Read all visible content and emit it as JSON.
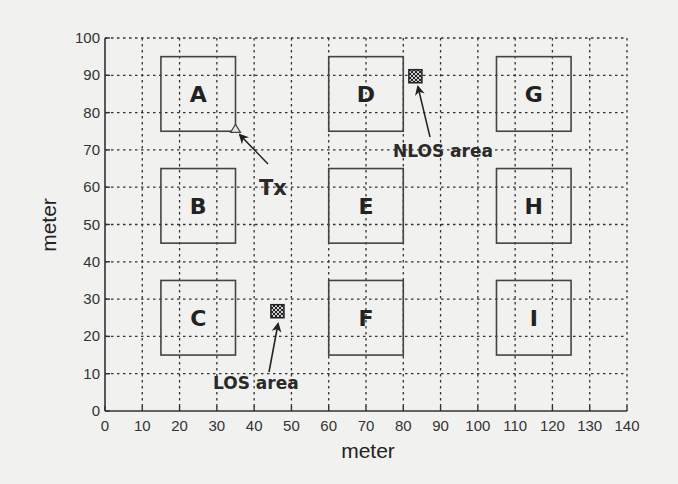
{
  "chart_data": {
    "type": "scatter",
    "title": "",
    "xlabel": "meter",
    "ylabel": "meter",
    "xlim": [
      0,
      140
    ],
    "ylim": [
      0,
      100
    ],
    "grid": true,
    "grid_style": "dotted",
    "xticks": [
      0,
      10,
      20,
      30,
      40,
      50,
      60,
      70,
      80,
      90,
      100,
      110,
      120,
      130,
      140
    ],
    "yticks": [
      0,
      10,
      20,
      30,
      40,
      50,
      60,
      70,
      80,
      90,
      100
    ],
    "buildings": [
      {
        "label": "A",
        "x0": 15,
        "x1": 35,
        "y0": 75,
        "y1": 95
      },
      {
        "label": "B",
        "x0": 15,
        "x1": 35,
        "y0": 45,
        "y1": 65
      },
      {
        "label": "C",
        "x0": 15,
        "x1": 35,
        "y0": 15,
        "y1": 35
      },
      {
        "label": "D",
        "x0": 60,
        "x1": 80,
        "y0": 75,
        "y1": 95
      },
      {
        "label": "E",
        "x0": 60,
        "x1": 80,
        "y0": 45,
        "y1": 65
      },
      {
        "label": "F",
        "x0": 60,
        "x1": 80,
        "y0": 15,
        "y1": 35
      },
      {
        "label": "G",
        "x0": 105,
        "x1": 125,
        "y0": 75,
        "y1": 95
      },
      {
        "label": "H",
        "x0": 105,
        "x1": 125,
        "y0": 45,
        "y1": 65
      },
      {
        "label": "I",
        "x0": 105,
        "x1": 125,
        "y0": 15,
        "y1": 35
      }
    ],
    "transmitter": {
      "label": "Tx",
      "x": 35,
      "y": 75.5,
      "marker": "triangle"
    },
    "areas": [
      {
        "label": "NLOS area",
        "x0": 81.5,
        "x1": 85,
        "y0": 88,
        "y1": 91.5,
        "pattern": "crosshatch"
      },
      {
        "label": "LOS area",
        "x0": 44.5,
        "x1": 48,
        "y0": 25,
        "y1": 28.5,
        "pattern": "crosshatch"
      }
    ],
    "annotations": [
      {
        "text": "Tx",
        "points_to": "transmitter"
      },
      {
        "text": "NLOS area",
        "points_to": "NLOS area"
      },
      {
        "text": "LOS area",
        "points_to": "LOS area"
      }
    ]
  },
  "labels": {
    "x_axis": "meter",
    "y_axis": "meter",
    "tx": "Tx",
    "nlos": "NLOS area",
    "los": "LOS area"
  }
}
